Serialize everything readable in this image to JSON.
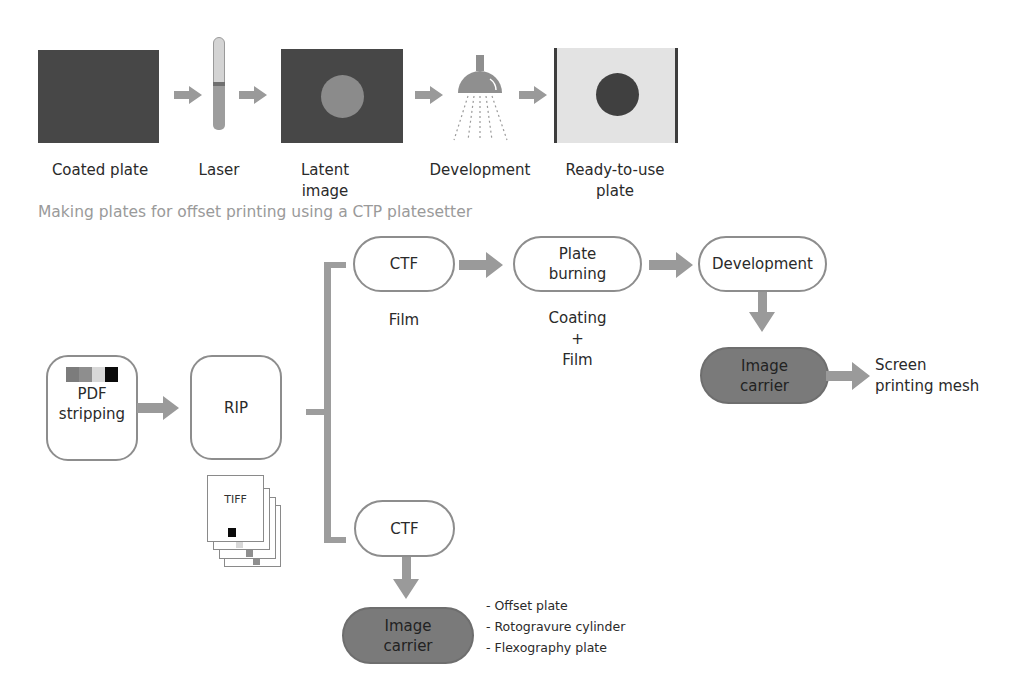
{
  "top_process": {
    "steps": [
      {
        "id": "coated-plate",
        "label_lines": [
          "Coated plate"
        ]
      },
      {
        "id": "laser",
        "label_lines": [
          "Laser"
        ]
      },
      {
        "id": "latent-image",
        "label_lines": [
          "Latent",
          "image"
        ]
      },
      {
        "id": "development",
        "label_lines": [
          "Development"
        ]
      },
      {
        "id": "ready-to-use-plate",
        "label_lines": [
          "Ready-to-use",
          "plate"
        ]
      }
    ],
    "caption": "Making plates for offset printing using a CTP platesetter"
  },
  "flow": {
    "pdf_stripping": {
      "label_lines": [
        "PDF",
        "stripping"
      ],
      "swatch_colors": [
        "#7c7c7c",
        "#8e8e8e",
        "#d8d8d8",
        "#0a0a0a"
      ]
    },
    "rip": {
      "label": "RIP"
    },
    "tiff": {
      "label": "TIFF",
      "pages": 4
    },
    "upper_branch": {
      "ctf": {
        "label": "CTF",
        "note": "Film"
      },
      "plate_burning": {
        "label_lines": [
          "Plate",
          "burning"
        ],
        "note_lines": [
          "Coating",
          "+",
          "Film"
        ]
      },
      "development": {
        "label": "Development"
      },
      "image_carrier": {
        "label_lines": [
          "Image",
          "carrier"
        ]
      },
      "output": {
        "label_lines": [
          "Screen",
          "printing mesh"
        ]
      }
    },
    "lower_branch": {
      "ctf": {
        "label": "CTF"
      },
      "image_carrier": {
        "label_lines": [
          "Image",
          "carrier"
        ]
      },
      "outputs": [
        "- Offset plate",
        "- Rotogravure cylinder",
        "- Flexography plate"
      ]
    }
  },
  "colors": {
    "arrow": "#999999",
    "dark_plate": "#474747",
    "light_plate": "#e3e3e3",
    "image_carrier_fill": "#7a7a7a",
    "caption_text": "#9a9a9a"
  }
}
